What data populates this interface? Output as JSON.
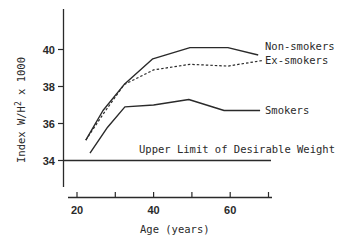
{
  "chart_data": {
    "type": "line",
    "title": "",
    "xlabel": "Age (years)",
    "ylabel": "Index W/H² x 1000",
    "ylabel_parts": {
      "prefix": "Index  W/H",
      "sup": "2",
      "suffix": " x 1000"
    },
    "xlim": [
      20,
      70
    ],
    "ylim": [
      32.7,
      42.7
    ],
    "x_ticks": [
      20,
      30,
      40,
      50,
      60,
      70
    ],
    "x_tick_labels": [
      "20",
      "",
      "40",
      "",
      "60",
      ""
    ],
    "y_ticks": [
      34,
      36,
      38,
      40
    ],
    "y_tick_labels": [
      "34",
      "36",
      "38",
      "40"
    ],
    "grid": false,
    "legend_position": "inline-right",
    "series": [
      {
        "name": "Non-smokers",
        "style": "solid",
        "x": [
          22.3,
          26.8,
          32.3,
          39.8,
          49.5,
          59.4,
          67.3
        ],
        "y": [
          35.1,
          36.7,
          38.1,
          39.5,
          40.1,
          40.1,
          39.7
        ]
      },
      {
        "name": "Ex-smokers",
        "style": "dashed",
        "x": [
          22.3,
          26.8,
          32.3,
          40.0,
          49.5,
          59.4,
          68.3
        ],
        "y": [
          35.1,
          36.5,
          38.1,
          38.9,
          39.2,
          39.1,
          39.4
        ]
      },
      {
        "name": "Smokers",
        "style": "solid",
        "x": [
          23.4,
          28.0,
          32.5,
          40.0,
          49.2,
          58.4,
          67.8
        ],
        "y": [
          34.4,
          35.8,
          36.9,
          37.0,
          37.3,
          36.7,
          36.7
        ]
      }
    ],
    "annotations": [
      {
        "text": "Upper Limit of Desirable Weight",
        "type": "hline",
        "y": 34
      }
    ]
  },
  "labels": {
    "non_smokers": "Non-smokers",
    "ex_smokers": "Ex-smokers",
    "smokers": "Smokers",
    "upper_limit": "Upper Limit of Desirable Weight"
  },
  "colors": {
    "line": "#2a2a2a",
    "background": "#ffffff"
  }
}
